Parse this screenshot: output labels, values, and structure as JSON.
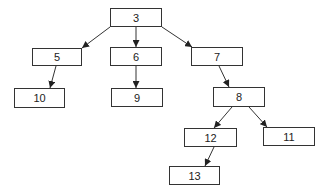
{
  "diagram": {
    "type": "tree",
    "colors": {
      "stroke": "#333333",
      "text": "#222222",
      "background": "#ffffff"
    },
    "nodes": [
      {
        "id": "3",
        "label": "3",
        "x": 110,
        "y": 8,
        "w": 52,
        "h": 19
      },
      {
        "id": "5",
        "label": "5",
        "x": 32,
        "y": 48,
        "w": 50,
        "h": 18
      },
      {
        "id": "6",
        "label": "6",
        "x": 110,
        "y": 47,
        "w": 52,
        "h": 19
      },
      {
        "id": "7",
        "label": "7",
        "x": 191,
        "y": 47,
        "w": 52,
        "h": 19
      },
      {
        "id": "10",
        "label": "10",
        "x": 14,
        "y": 88,
        "w": 51,
        "h": 20
      },
      {
        "id": "9",
        "label": "9",
        "x": 111,
        "y": 88,
        "w": 52,
        "h": 19
      },
      {
        "id": "8",
        "label": "8",
        "x": 213,
        "y": 87,
        "w": 52,
        "h": 20
      },
      {
        "id": "12",
        "label": "12",
        "x": 184,
        "y": 128,
        "w": 53,
        "h": 19
      },
      {
        "id": "11",
        "label": "11",
        "x": 263,
        "y": 127,
        "w": 52,
        "h": 19
      },
      {
        "id": "13",
        "label": "13",
        "x": 169,
        "y": 166,
        "w": 51,
        "h": 19
      }
    ],
    "edges": [
      {
        "from": "3",
        "to": "5",
        "x1": 110,
        "y1": 27,
        "x2": 82,
        "y2": 48
      },
      {
        "from": "3",
        "to": "6",
        "x1": 136,
        "y1": 27,
        "x2": 136,
        "y2": 47
      },
      {
        "from": "3",
        "to": "7",
        "x1": 162,
        "y1": 27,
        "x2": 192,
        "y2": 47
      },
      {
        "from": "5",
        "to": "10",
        "x1": 56,
        "y1": 66,
        "x2": 50,
        "y2": 88
      },
      {
        "from": "6",
        "to": "9",
        "x1": 136,
        "y1": 66,
        "x2": 136,
        "y2": 88
      },
      {
        "from": "7",
        "to": "8",
        "x1": 219,
        "y1": 66,
        "x2": 229,
        "y2": 87
      },
      {
        "from": "8",
        "to": "12",
        "x1": 232,
        "y1": 107,
        "x2": 214,
        "y2": 128
      },
      {
        "from": "8",
        "to": "11",
        "x1": 249,
        "y1": 107,
        "x2": 267,
        "y2": 127
      },
      {
        "from": "12",
        "to": "13",
        "x1": 214,
        "y1": 147,
        "x2": 205,
        "y2": 166
      }
    ]
  }
}
